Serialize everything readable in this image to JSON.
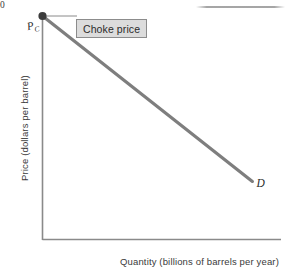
{
  "figure": {
    "background_color": "#ffffff",
    "axis_color": "#8a8a8a",
    "curve_color": "#7e7e7e",
    "point_color": "#3c3c3c",
    "callout_fill": "#dcdcdc",
    "callout_border": "#8c8c8c",
    "text_color": "#3a3a3a"
  },
  "annotations": {
    "choke_price_label": "Choke price",
    "choke_price_symbol": "P",
    "choke_price_subscript": "C",
    "demand_curve_label": "D",
    "origin_label": "0"
  },
  "chart_data": {
    "type": "line",
    "title": "",
    "subtitle": "",
    "xlabel": "Quantity (billions of barrels per year)",
    "ylabel": "Price (dollars per barrel)",
    "xlim": [
      0,
      100
    ],
    "ylim": [
      0,
      100
    ],
    "grid": false,
    "legend_position": "none",
    "x_tick_labels": [],
    "y_tick_labels": [
      "0"
    ],
    "series": [
      {
        "name": "D",
        "label": "D",
        "type": "line",
        "color": "#7e7e7e",
        "linewidth": 3,
        "x": [
          0,
          88
        ],
        "y": [
          100,
          26
        ],
        "endpoint_label": "D",
        "markers": [
          {
            "name": "choke-price-point",
            "x": 0,
            "y": 100,
            "label": "P",
            "sublabel": "C",
            "annotation": "Choke price"
          }
        ]
      }
    ]
  }
}
